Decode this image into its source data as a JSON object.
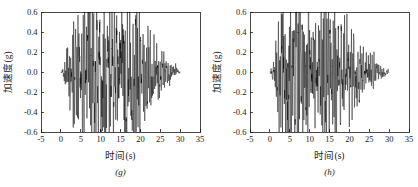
{
  "figure": {
    "background_color": "#ffffff",
    "line_color": "#000000",
    "axis_color": "#1a1a1a"
  },
  "chart_data": [
    {
      "type": "line",
      "title": "",
      "subtitle": "",
      "panel_label": "(g)",
      "xlabel": "时间(s)",
      "ylabel": "加速度(g)",
      "xlim": [
        -5,
        35
      ],
      "ylim": [
        -0.6,
        0.6
      ],
      "xticks": [
        -5,
        0,
        5,
        10,
        15,
        20,
        25,
        30,
        35
      ],
      "xticklabels": [
        "-5",
        "0",
        "5",
        "10",
        "15",
        "20",
        "25",
        "30",
        "35"
      ],
      "yticks": [
        -0.6,
        -0.4,
        -0.2,
        0.0,
        0.2,
        0.4,
        0.6
      ],
      "yticklabels": [
        "-0.6",
        "-0.4",
        "-0.2",
        "0.0",
        "0.2",
        "0.4",
        "0.6"
      ],
      "grid": false,
      "legend": null,
      "series_name": "加速度时程",
      "data_start_time": 0,
      "data_end_time": 30,
      "sample_interval": 0.02,
      "peak_positive": 0.43,
      "peak_positive_time": 9.8,
      "peak_negative": -0.4,
      "peak_negative_time": 13.1,
      "envelope_description": "Seismic accelerogram: rapid rise from 0 s, strong motion between 5 s and 20 s peaking near 10 s, gradual decay to near zero by 30 s.",
      "envelope_points": [
        {
          "t": 0.0,
          "a": 0.005
        },
        {
          "t": 0.6,
          "a": 0.02
        },
        {
          "t": 1.2,
          "a": 0.05
        },
        {
          "t": 2.0,
          "a": 0.09
        },
        {
          "t": 3.0,
          "a": 0.13
        },
        {
          "t": 4.0,
          "a": 0.17
        },
        {
          "t": 5.0,
          "a": 0.23
        },
        {
          "t": 6.0,
          "a": 0.27
        },
        {
          "t": 7.0,
          "a": 0.3
        },
        {
          "t": 8.0,
          "a": 0.29
        },
        {
          "t": 9.0,
          "a": 0.33
        },
        {
          "t": 10.0,
          "a": 0.43
        },
        {
          "t": 11.0,
          "a": 0.33
        },
        {
          "t": 12.0,
          "a": 0.3
        },
        {
          "t": 13.0,
          "a": 0.4
        },
        {
          "t": 14.0,
          "a": 0.31
        },
        {
          "t": 15.0,
          "a": 0.29
        },
        {
          "t": 16.0,
          "a": 0.3
        },
        {
          "t": 17.0,
          "a": 0.26
        },
        {
          "t": 18.0,
          "a": 0.24
        },
        {
          "t": 19.0,
          "a": 0.33
        },
        {
          "t": 20.0,
          "a": 0.22
        },
        {
          "t": 21.0,
          "a": 0.16
        },
        {
          "t": 22.0,
          "a": 0.13
        },
        {
          "t": 23.0,
          "a": 0.12
        },
        {
          "t": 24.0,
          "a": 0.11
        },
        {
          "t": 25.0,
          "a": 0.09
        },
        {
          "t": 26.0,
          "a": 0.07
        },
        {
          "t": 27.0,
          "a": 0.05
        },
        {
          "t": 28.0,
          "a": 0.035
        },
        {
          "t": 29.0,
          "a": 0.02
        },
        {
          "t": 30.0,
          "a": 0.005
        }
      ],
      "seed": 20147
    },
    {
      "type": "line",
      "title": "",
      "subtitle": "",
      "panel_label": "(h)",
      "xlabel": "时间(s)",
      "ylabel": "加速度(g)",
      "xlim": [
        -5,
        35
      ],
      "ylim": [
        -0.6,
        0.6
      ],
      "xticks": [
        -5,
        0,
        5,
        10,
        15,
        20,
        25,
        30,
        35
      ],
      "xticklabels": [
        "-5",
        "0",
        "5",
        "10",
        "15",
        "20",
        "25",
        "30",
        "35"
      ],
      "yticks": [
        -0.6,
        -0.4,
        -0.2,
        0.0,
        0.2,
        0.4,
        0.6
      ],
      "yticklabels": [
        "-0.6",
        "-0.4",
        "-0.2",
        "0.0",
        "0.2",
        "0.4",
        "0.6"
      ],
      "grid": false,
      "legend": null,
      "series_name": "加速度时程",
      "data_start_time": 0,
      "data_end_time": 30,
      "sample_interval": 0.02,
      "peak_positive": 0.4,
      "peak_positive_time": 3.6,
      "peak_negative": -0.44,
      "peak_negative_time": 6.7,
      "envelope_description": "Seismic accelerogram: abrupt onset near 2 s, strongest shaking between 3 s and 8 s, sustained moderate motion to 22 s, decaying to near zero by 30 s.",
      "envelope_points": [
        {
          "t": 0.0,
          "a": 0.005
        },
        {
          "t": 0.5,
          "a": 0.03
        },
        {
          "t": 1.0,
          "a": 0.07
        },
        {
          "t": 1.6,
          "a": 0.12
        },
        {
          "t": 2.2,
          "a": 0.2
        },
        {
          "t": 3.0,
          "a": 0.3
        },
        {
          "t": 3.6,
          "a": 0.4
        },
        {
          "t": 4.2,
          "a": 0.31
        },
        {
          "t": 5.0,
          "a": 0.33
        },
        {
          "t": 5.8,
          "a": 0.3
        },
        {
          "t": 6.7,
          "a": 0.44
        },
        {
          "t": 7.5,
          "a": 0.27
        },
        {
          "t": 8.5,
          "a": 0.24
        },
        {
          "t": 9.5,
          "a": 0.26
        },
        {
          "t": 10.5,
          "a": 0.25
        },
        {
          "t": 11.5,
          "a": 0.22
        },
        {
          "t": 12.5,
          "a": 0.24
        },
        {
          "t": 13.5,
          "a": 0.34
        },
        {
          "t": 14.5,
          "a": 0.23
        },
        {
          "t": 15.0,
          "a": 0.32
        },
        {
          "t": 16.0,
          "a": 0.21
        },
        {
          "t": 17.0,
          "a": 0.19
        },
        {
          "t": 18.0,
          "a": 0.2
        },
        {
          "t": 19.0,
          "a": 0.18
        },
        {
          "t": 20.0,
          "a": 0.16
        },
        {
          "t": 21.0,
          "a": 0.14
        },
        {
          "t": 22.0,
          "a": 0.13
        },
        {
          "t": 23.0,
          "a": 0.11
        },
        {
          "t": 24.0,
          "a": 0.1
        },
        {
          "t": 25.0,
          "a": 0.07
        },
        {
          "t": 26.0,
          "a": 0.05
        },
        {
          "t": 27.0,
          "a": 0.04
        },
        {
          "t": 28.0,
          "a": 0.025
        },
        {
          "t": 29.0,
          "a": 0.015
        },
        {
          "t": 30.0,
          "a": 0.005
        }
      ],
      "seed": 77431
    }
  ]
}
